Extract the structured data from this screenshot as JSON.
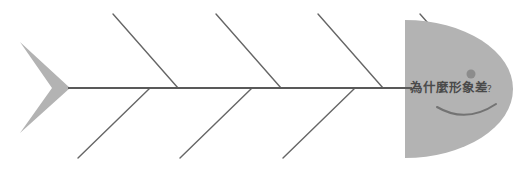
{
  "diagram": {
    "type": "fishbone-ishikawa",
    "title_text": "為什麼形象差",
    "title_question_mark": "？",
    "head_label_full": "為什麼形象差 ？",
    "background_color": "#ffffff",
    "fish_fill_color": "#b3b3b3",
    "bone_line_color": "#666666",
    "spine_line_color": "#595959",
    "eye_color": "#8c8c8c",
    "mouth_color": "#737373",
    "text_color": "#4a4a4a",
    "spine": {
      "x_start": 68,
      "x_end": 412,
      "y": 88
    },
    "tail": {
      "top_tip_x": 20,
      "top_tip_y": 42,
      "bottom_tip_x": 20,
      "bottom_tip_y": 133,
      "join_x": 70,
      "join_y": 88,
      "notch_x": 52,
      "notch_y": 88
    },
    "head": {
      "left_x": 405,
      "top_y": 20,
      "bottom_y": 158,
      "right_x": 513,
      "eye_cx": 471,
      "eye_cy": 74,
      "eye_r": 4.5,
      "mouth_label": "smile"
    },
    "upper_bones": [
      {
        "name": "upper-bone-1",
        "x1": 113,
        "y1": 14,
        "x2": 178,
        "y2": 88
      },
      {
        "name": "upper-bone-2",
        "x1": 216,
        "y1": 14,
        "x2": 281,
        "y2": 88
      },
      {
        "name": "upper-bone-3",
        "x1": 318,
        "y1": 14,
        "x2": 383,
        "y2": 88
      },
      {
        "name": "upper-bone-4",
        "x1": 420,
        "y1": 14,
        "x2": 485,
        "y2": 88
      }
    ],
    "lower_bones": [
      {
        "name": "lower-bone-1",
        "x1": 150,
        "y1": 88,
        "x2": 78,
        "y2": 158
      },
      {
        "name": "lower-bone-2",
        "x1": 252,
        "y1": 88,
        "x2": 180,
        "y2": 158
      },
      {
        "name": "lower-bone-3",
        "x1": 355,
        "y1": 88,
        "x2": 283,
        "y2": 158
      }
    ]
  }
}
